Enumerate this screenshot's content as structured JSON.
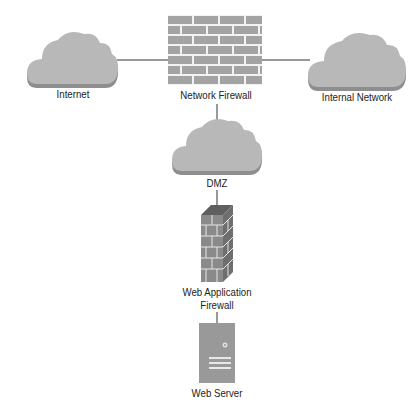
{
  "diagram": {
    "type": "network-topology",
    "nodes": [
      {
        "id": "internet",
        "label": "Internet",
        "shape": "cloud"
      },
      {
        "id": "network_firewall",
        "label": "Network Firewall",
        "shape": "brick-wall"
      },
      {
        "id": "internal_network",
        "label": "Internal Network",
        "shape": "cloud"
      },
      {
        "id": "dmz",
        "label": "DMZ",
        "shape": "cloud"
      },
      {
        "id": "waf",
        "label_line1": "Web Application",
        "label_line2": "Firewall",
        "shape": "brick-pillar"
      },
      {
        "id": "web_server",
        "label": "Web Server",
        "shape": "server-tower"
      }
    ],
    "edges": [
      {
        "from": "internet",
        "to": "network_firewall"
      },
      {
        "from": "network_firewall",
        "to": "internal_network"
      },
      {
        "from": "network_firewall",
        "to": "dmz"
      },
      {
        "from": "dmz",
        "to": "waf"
      },
      {
        "from": "waf",
        "to": "web_server"
      }
    ],
    "colors": {
      "cloud_fill": "#b8b8b8",
      "cloud_shadow": "#8e8e8e",
      "brick_fill": "#a3a3a3",
      "mortar": "#f2f2f2",
      "pillar_front": "#8a8a8a",
      "pillar_side": "#6e6e6e",
      "pillar_top": "#5f5f5f",
      "server_fill": "#999999",
      "line": "#333333",
      "text": "#222222"
    }
  }
}
